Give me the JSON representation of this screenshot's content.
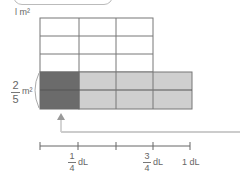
{
  "diagram": {
    "area_label": "1 m²",
    "area_label_num": "l",
    "area_label_unit": "m²",
    "fraction_area": {
      "numerator": "2",
      "denominator": "5",
      "unit": "m²"
    },
    "grid": {
      "columns": 3,
      "rows": 5,
      "shaded_rows": 2,
      "extended_columns": 4,
      "dark_columns": 1,
      "colors": {
        "dark": "#6b6b6b",
        "light": "#cfcfcf",
        "line": "#777777",
        "empty": "#ffffff"
      }
    },
    "number_line": {
      "ticks": 5,
      "labels": [
        {
          "numerator": "1",
          "denominator": "4",
          "unit": "dL"
        },
        {
          "numerator": "3",
          "denominator": "4",
          "unit": "dL"
        },
        {
          "whole": "1 dL"
        }
      ]
    }
  }
}
